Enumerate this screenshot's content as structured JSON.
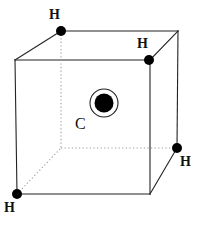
{
  "figure": {
    "width": 202,
    "height": 226,
    "background_color": "#ffffff",
    "line_color": "#222222",
    "dotted_line_color": "#9a9a9a",
    "atom_fill_color": "#000000"
  },
  "atoms": {
    "carbon": {
      "symbol": "C",
      "label": "C",
      "cx": 104,
      "cy": 103,
      "inner_radius": 9.5,
      "outer_radius": 14,
      "label_x": 75,
      "label_y": 116
    },
    "hydrogens": [
      {
        "symbol": "H",
        "label": "H",
        "id": "h-top-back-left",
        "cx": 61,
        "cy": 31,
        "radius": 5,
        "label_x": 49,
        "label_y": 8
      },
      {
        "symbol": "H",
        "label": "H",
        "id": "h-top-front-right",
        "cx": 149,
        "cy": 60,
        "radius": 5,
        "label_x": 137,
        "label_y": 37
      },
      {
        "symbol": "H",
        "label": "H",
        "id": "h-bottom-back-right",
        "cx": 177,
        "cy": 148,
        "radius": 5,
        "label_x": 180,
        "label_y": 155
      },
      {
        "symbol": "H",
        "label": "H",
        "id": "h-bottom-front-left",
        "cx": 17,
        "cy": 194,
        "radius": 5,
        "label_x": 4,
        "label_y": 201
      }
    ]
  },
  "cube": {
    "vertices": {
      "front_top_left": [
        15,
        60
      ],
      "front_top_right": [
        150,
        60
      ],
      "front_bottom_left": [
        17,
        194
      ],
      "front_bottom_right": [
        150,
        194
      ],
      "back_top_left": [
        61,
        31
      ],
      "back_top_right": [
        178,
        31
      ],
      "back_bottom_left": [
        61,
        148
      ],
      "back_bottom_right": [
        177,
        148
      ]
    },
    "solid_edges": [
      [
        15,
        60,
        150,
        60
      ],
      [
        150,
        60,
        150,
        194
      ],
      [
        150,
        194,
        17,
        194
      ],
      [
        17,
        194,
        15,
        60
      ],
      [
        61,
        31,
        178,
        31
      ],
      [
        178,
        31,
        177,
        148
      ],
      [
        15,
        60,
        61,
        31
      ],
      [
        150,
        60,
        178,
        31
      ],
      [
        150,
        194,
        177,
        148
      ]
    ],
    "dotted_edges": [
      [
        61,
        31,
        61,
        148
      ],
      [
        61,
        148,
        177,
        148
      ],
      [
        17,
        194,
        61,
        148
      ]
    ]
  }
}
